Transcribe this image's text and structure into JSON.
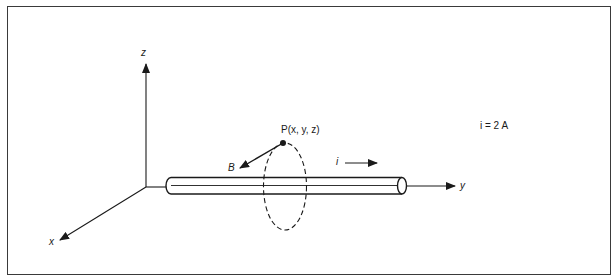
{
  "diagram": {
    "axes": {
      "z_label": "z",
      "y_label": "y",
      "x_label": "x"
    },
    "point_label": "P(x, y, z)",
    "field_label": "B",
    "current_label": "i",
    "current_value": "i = 2 A",
    "colors": {
      "line": "#1a1a1a",
      "background": "#ffffff",
      "frame": "#3a3a3a"
    }
  }
}
